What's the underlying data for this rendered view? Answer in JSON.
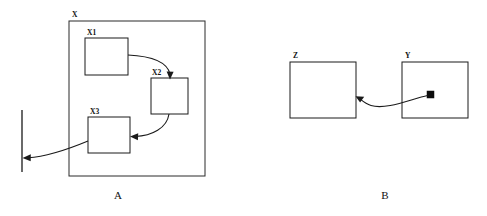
{
  "figure": {
    "title": "",
    "panels": [
      {
        "id": "panel-a",
        "caption": "A",
        "caption_x": 118,
        "caption_y": 199,
        "container": {
          "label": "X",
          "label_x": 72,
          "label_y": 17,
          "x": 69,
          "y": 21,
          "width": 136,
          "height": 155
        },
        "nodes": [
          {
            "label": "X1",
            "label_x": 87,
            "label_y": 35,
            "x": 85,
            "y": 38,
            "width": 43,
            "height": 37
          },
          {
            "label": "X2",
            "label_x": 152,
            "label_y": 75,
            "x": 151,
            "y": 78,
            "width": 37,
            "height": 36
          },
          {
            "label": "X3",
            "label_x": 90,
            "label_y": 114,
            "x": 88,
            "y": 117,
            "width": 42,
            "height": 36
          }
        ],
        "edges": [
          {
            "name": "edge-x1-to-x2",
            "from": "X1",
            "to": "X2",
            "path": "M 128 55 C 148 56 166 62 169 75",
            "arrow_x": 169.5,
            "arrow_y": 78,
            "arrow_dir": "down"
          },
          {
            "name": "edge-x2-to-x3",
            "from": "X2",
            "to": "X3",
            "path": "M 170 114 C 167 127 152 135 134 136",
            "arrow_x": 130.5,
            "arrow_y": 136,
            "arrow_dir": "left"
          },
          {
            "name": "edge-x3-to-boundary",
            "from": "X3",
            "to": "boundary-line",
            "path": "M 88 142 C 70 149 48 156 27 158",
            "arrow_x": 23.5,
            "arrow_y": 158,
            "arrow_dir": "left"
          }
        ],
        "boundary_line": {
          "name": "environment-boundary",
          "x": 22,
          "y1": 110,
          "y2": 172
        }
      },
      {
        "id": "panel-b",
        "caption": "B",
        "caption_x": 385,
        "caption_y": 199,
        "container": null,
        "nodes": [
          {
            "label": "Z",
            "label_x": 293,
            "label_y": 58,
            "x": 290,
            "y": 62,
            "width": 66,
            "height": 56
          },
          {
            "label": "Y",
            "label_x": 405,
            "label_y": 58,
            "x": 402,
            "y": 62,
            "width": 66,
            "height": 56
          }
        ],
        "marker": {
          "name": "state-marker",
          "x": 427,
          "y": 91,
          "size": 7
        },
        "edges": [
          {
            "name": "edge-y-to-z",
            "from": "Y",
            "to": "Z",
            "path": "M 427 95 C 408 99 384 109 368 105 C 364 104 362 102 360 100",
            "arrow_x": 356.5,
            "arrow_y": 98,
            "arrow_dir": "left-up"
          }
        ],
        "boundary_line": null
      }
    ],
    "colors": {
      "stroke": "#1a1a1a",
      "background": "#ffffff",
      "marker_fill": "#0d0d0d"
    }
  }
}
